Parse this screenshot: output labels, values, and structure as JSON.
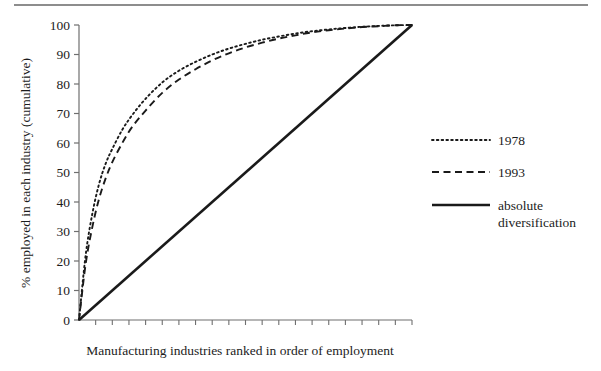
{
  "chart_data": {
    "type": "line",
    "title": "",
    "xlabel": "Manufacturing industries ranked in order of employment",
    "ylabel": "% employed in each industry (cumulative)",
    "xlim": [
      0,
      100
    ],
    "ylim": [
      0,
      100
    ],
    "grid": false,
    "legend_position": "right",
    "y_ticks": [
      0,
      10,
      20,
      30,
      40,
      50,
      60,
      70,
      80,
      90,
      100
    ],
    "y_tick_labels": [
      "0",
      "10",
      "20",
      "30",
      "40",
      "50",
      "60",
      "70",
      "80",
      "90",
      "100"
    ],
    "x_ticks_count": 20,
    "x_tick_labels": [],
    "series": [
      {
        "name": "1978",
        "style": "dotted",
        "color": "#1a1a1a",
        "x": [
          0,
          2,
          4,
          6,
          8,
          10,
          13,
          16,
          20,
          25,
          30,
          35,
          40,
          45,
          50,
          55,
          60,
          65,
          70,
          75,
          80,
          85,
          90,
          95,
          100
        ],
        "y": [
          0,
          22,
          36,
          46,
          53,
          58,
          64.5,
          69.5,
          75,
          80.5,
          84.5,
          87.5,
          90,
          92,
          93.6,
          95,
          96.1,
          97.1,
          97.9,
          98.5,
          99,
          99.4,
          99.7,
          99.9,
          100
        ]
      },
      {
        "name": "1993",
        "style": "dashed",
        "color": "#1a1a1a",
        "x": [
          0,
          2,
          4,
          6,
          8,
          10,
          13,
          16,
          20,
          25,
          30,
          35,
          40,
          45,
          50,
          55,
          60,
          65,
          70,
          75,
          80,
          85,
          90,
          95,
          100
        ],
        "y": [
          0,
          19,
          31.5,
          41,
          48,
          53.5,
          60,
          65.5,
          71,
          77,
          81.5,
          85,
          88,
          90.4,
          92.4,
          94,
          95.4,
          96.5,
          97.5,
          98.2,
          98.8,
          99.3,
          99.6,
          99.9,
          100
        ]
      },
      {
        "name": "absolute diversification",
        "style": "solid",
        "color": "#1a1a1a",
        "x": [
          0,
          100
        ],
        "y": [
          0,
          100
        ]
      }
    ]
  },
  "legend": {
    "entries": [
      {
        "label": "1978",
        "style": "dotted"
      },
      {
        "label": "1993",
        "style": "dashed"
      },
      {
        "label": "absolute",
        "label2": "diversification",
        "style": "solid"
      }
    ]
  }
}
